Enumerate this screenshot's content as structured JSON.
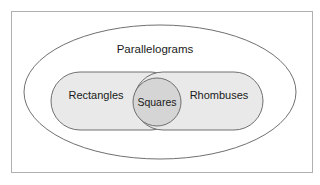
{
  "figure": {
    "type": "venn-diagram",
    "title": "",
    "width": 320,
    "height": 185,
    "background_color": "#ffffff",
    "frame": {
      "name": "diagram-frame",
      "stroke_color": "#b0b0b0",
      "x": 11,
      "y": 11,
      "width": 302,
      "height": 162
    }
  },
  "sets": {
    "universe": {
      "label": "Parallelograms",
      "shape": "ellipse",
      "fill_color": "#ffffff",
      "stroke_color": "#707070",
      "cx": 160,
      "cy": 92,
      "rx": 136,
      "ry": 67,
      "label_x": 155,
      "label_y": 50
    },
    "left": {
      "label": "Rectangles",
      "shape": "rounded-stadium",
      "fill_color": "#e9e9e9",
      "stroke_color": "#707070",
      "x": 51,
      "y": 72,
      "width": 129,
      "height": 58,
      "label_x": 96,
      "label_y": 96
    },
    "right": {
      "label": "Rhombuses",
      "shape": "rounded-stadium",
      "fill_color": "#e9e9e9",
      "stroke_color": "#707070",
      "x": 134,
      "y": 72,
      "width": 129,
      "height": 58,
      "label_x": 219,
      "label_y": 96
    },
    "intersection": {
      "label": "Squares",
      "shape": "circle",
      "fill_color": "#d5d5d5",
      "stroke_color": "#707070",
      "cx": 157,
      "cy": 102,
      "r": 24,
      "label_x": 157,
      "label_y": 103
    }
  },
  "colors": {
    "text": "#1a1a1a",
    "outline": "#707070",
    "frame": "#b0b0b0",
    "set_fill": "#e9e9e9",
    "intersection_fill": "#d5d5d5",
    "page_background": "#ffffff"
  }
}
